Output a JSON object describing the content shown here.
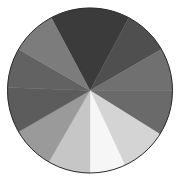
{
  "chart_data": {
    "type": "pie",
    "title": "",
    "xlabel": "",
    "ylabel": "",
    "legend": [],
    "labels_visible": false,
    "center": [
      90,
      90.5
    ],
    "radius": 82.5,
    "start_angle_deg": -28,
    "direction": "clockwise",
    "categories": [
      "S1",
      "S2",
      "S3",
      "S4",
      "S5",
      "S6",
      "S7",
      "S8",
      "S9",
      "S10",
      "S11"
    ],
    "values": [
      56,
      32,
      30,
      32,
      33,
      25,
      30,
      30,
      32,
      28,
      32
    ],
    "colors": [
      "#3b3b3b",
      "#4f4f4f",
      "#707070",
      "#6a6a6a",
      "#d4d4d4",
      "#f6f6f6",
      "#c6c6c6",
      "#9a9a9a",
      "#5c5c5c",
      "#626262",
      "#7c7c7c"
    ],
    "outline_color": "#2a2a2a"
  }
}
